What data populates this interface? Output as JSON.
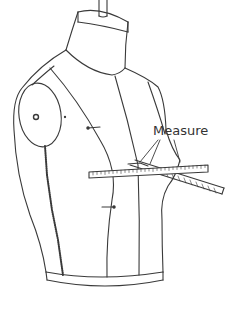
{
  "figure": {
    "label": "Measure",
    "colors": {
      "background": "#ffffff",
      "stroke": "#3a3a3a",
      "label": "#333333"
    },
    "parts": [
      "stand-pole",
      "neck-cap",
      "shoulder-cap",
      "front-seams",
      "side-zipper-seam",
      "pin-markers",
      "hem-band",
      "measuring-tape-horizontal",
      "measuring-tape-diagonal",
      "label-leader-lines"
    ]
  }
}
